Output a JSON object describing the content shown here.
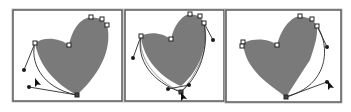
{
  "colors": {
    "fill": "#7a7a7a",
    "frame": "#5a5a5a",
    "background": "#ffffff"
  },
  "panels": [
    {
      "name": "panel-1",
      "x": 13,
      "y": 10,
      "w": 109,
      "h": 91
    },
    {
      "name": "panel-2",
      "x": 125,
      "y": 10,
      "w": 99,
      "h": 91
    },
    {
      "name": "panel-3",
      "x": 226,
      "y": 10,
      "w": 115,
      "h": 92
    }
  ],
  "icons": {
    "anchor_point": "anchor-square-icon",
    "direction_handle": "handle-dot-icon",
    "cursor": "direct-selection-arrow-icon"
  }
}
